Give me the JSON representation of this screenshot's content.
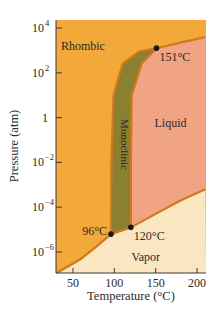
{
  "chart_data": {
    "type": "area",
    "title": "",
    "subtitle": "",
    "xlabel": "Temperature (°C)",
    "ylabel": "Pressure (atm)",
    "xlim": [
      30,
      210
    ],
    "ylim_log10": [
      -7.2,
      4.2
    ],
    "yscale": "log",
    "grid": false,
    "legend": "none",
    "x_ticks": [
      {
        "value": 50,
        "label": "50"
      },
      {
        "value": 100,
        "label": "100"
      },
      {
        "value": 150,
        "label": "150"
      },
      {
        "value": 200,
        "label": "200"
      }
    ],
    "y_ticks": [
      {
        "log10": 4,
        "base": "10",
        "exp": "4",
        "label": "10^4"
      },
      {
        "log10": 2,
        "base": "10",
        "exp": "2",
        "label": "10^2"
      },
      {
        "log10": 0,
        "base": "1",
        "exp": "",
        "label": "1"
      },
      {
        "log10": -2,
        "base": "10",
        "exp": "−2",
        "label": "10^-2"
      },
      {
        "log10": -4,
        "base": "10",
        "exp": "−4",
        "label": "10^-4"
      },
      {
        "log10": -6,
        "base": "10",
        "exp": "−6",
        "label": "10^-6"
      }
    ],
    "regions": [
      {
        "name": "Rhombic",
        "color": "#f2a93a"
      },
      {
        "name": "Monoclinic",
        "color": "#8a8030"
      },
      {
        "name": "Liquid",
        "color": "#f0a484"
      },
      {
        "name": "Vapor",
        "color": "#fbe6c2"
      }
    ],
    "boundary_color": "#d0781e",
    "triple_points": [
      {
        "label": "96°C",
        "T": 96,
        "log10P": -5.2
      },
      {
        "label": "120°C",
        "T": 120,
        "log10P": -4.9
      },
      {
        "label": "151°C",
        "T": 151,
        "log10P": 3.1
      }
    ],
    "region_labels": [
      {
        "text": "Rhombic",
        "T": 62,
        "log10P": 3.0
      },
      {
        "text": "Monoclinic",
        "T": 108,
        "log10P": -1.2,
        "rotate": true
      },
      {
        "text": "Liquid",
        "T": 168,
        "log10P": -0.4
      },
      {
        "text": "Vapor",
        "T": 138,
        "log10P": -6.4
      }
    ],
    "curves": {
      "sublimation_rhombic": [
        [
          30,
          -7.0
        ],
        [
          60,
          -6.3
        ],
        [
          80,
          -5.7
        ],
        [
          96,
          -5.2
        ]
      ],
      "rhombic_monoclinic": [
        [
          96,
          -5.2
        ],
        [
          96.5,
          -2.0
        ],
        [
          99,
          1.0
        ],
        [
          110,
          2.4
        ],
        [
          130,
          2.95
        ],
        [
          151,
          3.1
        ]
      ],
      "sublimation_monoclinic": [
        [
          96,
          -5.2
        ],
        [
          120,
          -4.9
        ]
      ],
      "monoclinic_liquid": [
        [
          120,
          -4.9
        ],
        [
          120,
          -2.0
        ],
        [
          121,
          1.0
        ],
        [
          133,
          2.4
        ],
        [
          151,
          3.1
        ]
      ],
      "vaporization": [
        [
          120,
          -4.9
        ],
        [
          150,
          -4.3
        ],
        [
          180,
          -3.7
        ],
        [
          210,
          -3.2
        ]
      ],
      "rhombic_liquid": [
        [
          151,
          3.1
        ],
        [
          180,
          3.35
        ],
        [
          210,
          3.6
        ]
      ]
    }
  }
}
